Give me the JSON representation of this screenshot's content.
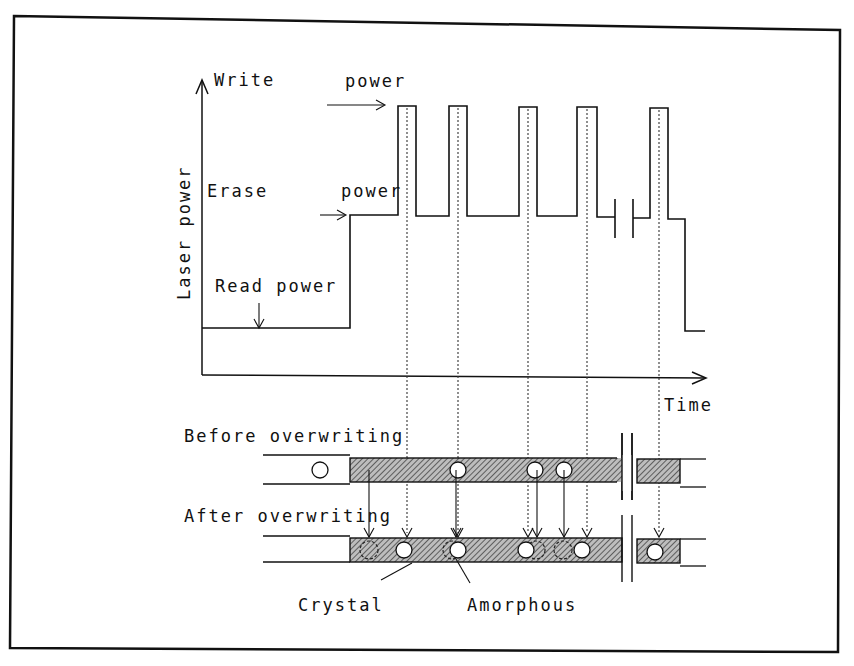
{
  "diagram": {
    "y_axis_label": "Laser power",
    "x_axis_label": "Time",
    "levels": {
      "write_label_1": "Write",
      "write_label_2": "power",
      "erase_label_1": "Erase",
      "erase_label_2": "power",
      "read_label": "Read power"
    },
    "tracks": {
      "before_label": "Before overwriting",
      "after_label": "After overwriting"
    },
    "legend": {
      "crystal": "Crystal",
      "amorphous": "Amorphous"
    },
    "pulses": [
      {
        "start": 398,
        "end": 416
      },
      {
        "start": 449,
        "end": 467
      },
      {
        "start": 519,
        "end": 537
      },
      {
        "start": 577,
        "end": 597
      },
      {
        "start": 650,
        "end": 668
      }
    ],
    "before_marks_x": [
      320,
      457,
      533,
      563
    ],
    "after_new_marks_x": [
      407,
      457,
      528,
      587,
      659
    ],
    "after_erased_marks_x": [
      320,
      457,
      535,
      563
    ],
    "colors": {
      "line": "#111111",
      "hatch": "#555555",
      "background": "#ffffff"
    }
  }
}
